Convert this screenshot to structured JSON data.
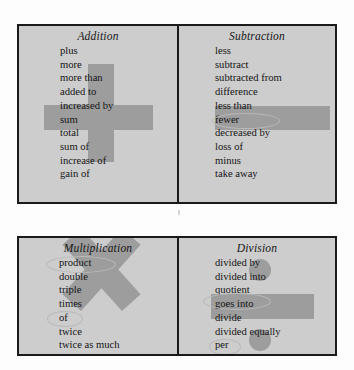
{
  "document": {
    "kind": "math-key-words-chart",
    "background_color": "#ffffff",
    "panel_color": "#cdcdcd",
    "border_color": "#1a1a1a",
    "highlight_color": "#9d9d9d",
    "ring_color": "#b9b9b9"
  },
  "tables": [
    {
      "id": "table-top",
      "panels": [
        {
          "id": "panel-addition",
          "title": "Addition",
          "symbol": "plus-sign",
          "words": [
            "plus",
            "more",
            "more than",
            "added to",
            "increased by",
            "sum",
            "total",
            "sum of",
            "increase of",
            "gain of"
          ],
          "rings": []
        },
        {
          "id": "panel-subtraction",
          "title": "Subtraction",
          "symbol": "minus-sign",
          "words": [
            "less",
            "subtract",
            "subtracted from",
            "difference",
            "less than",
            "fewer",
            "decreased by",
            "loss of",
            "minus",
            "take away"
          ],
          "rings": [
            "difference"
          ]
        }
      ]
    },
    {
      "id": "table-bottom",
      "panels": [
        {
          "id": "panel-multiplication",
          "title": "Multiplication",
          "symbol": "times-sign",
          "words": [
            "product",
            "double",
            "triple",
            "times",
            "of",
            "twice",
            "twice as much"
          ],
          "rings": [
            "product",
            "of"
          ]
        },
        {
          "id": "panel-division",
          "title": "Division",
          "symbol": "division-sign",
          "words": [
            "divided by",
            "divided into",
            "quotient",
            "goes into",
            "divide",
            "divided equally",
            "per"
          ],
          "rings": [
            "quotient",
            "per"
          ]
        }
      ]
    }
  ]
}
